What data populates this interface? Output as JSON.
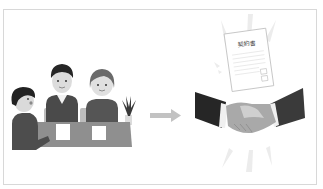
{
  "caption": "",
  "illustration": {
    "left_scene": "meeting",
    "right_scene": "handshake",
    "document_title": "契約書",
    "arrow": "right-arrow",
    "colors": {
      "frame": "#d8d8d8",
      "hair": "#2a2a2a",
      "suit_dark": "#2f2f2f",
      "suit_mid": "#5a5a5a",
      "skin": "#d9d9d9",
      "table": "#8a8a8a",
      "paper": "#ffffff",
      "arrow": "#bdbdbd",
      "rays": "#ececec"
    }
  }
}
